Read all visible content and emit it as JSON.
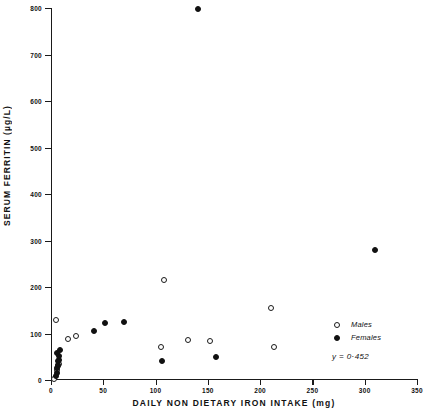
{
  "chart_data": {
    "type": "scatter",
    "title": "",
    "xlabel": "DAILY  NON DIETARY  IRON  INTAKE  (mg)",
    "ylabel": "SERUM  FERRITIN  (µg/L)",
    "xlim": [
      0,
      350
    ],
    "ylim": [
      0,
      800
    ],
    "xticks": [
      0,
      50,
      100,
      150,
      200,
      250,
      300,
      350
    ],
    "yticks": [
      0,
      100,
      200,
      300,
      400,
      500,
      600,
      700,
      800
    ],
    "xtick_labels": [
      "0",
      "50",
      "100",
      "150",
      "200",
      "250",
      "300",
      "350"
    ],
    "ytick_labels": [
      "0",
      "100",
      "200",
      "300",
      "400",
      "500",
      "600",
      "700",
      "800"
    ],
    "grid": false,
    "legend_position": "bottom-right",
    "annotations": [
      "y = 0·452"
    ],
    "series": [
      {
        "name": "Males",
        "marker": "open-circle",
        "color": "#111111",
        "points": [
          {
            "x": 3,
            "y": 2
          },
          {
            "x": 6,
            "y": 22
          },
          {
            "x": 7,
            "y": 30
          },
          {
            "x": 8,
            "y": 35
          },
          {
            "x": 5,
            "y": 130
          },
          {
            "x": 16,
            "y": 88
          },
          {
            "x": 24,
            "y": 95
          },
          {
            "x": 108,
            "y": 215
          },
          {
            "x": 105,
            "y": 72
          },
          {
            "x": 131,
            "y": 85
          },
          {
            "x": 152,
            "y": 83
          },
          {
            "x": 210,
            "y": 155
          },
          {
            "x": 213,
            "y": 72
          }
        ]
      },
      {
        "name": "Females",
        "marker": "filled-circle",
        "color": "#111111",
        "points": [
          {
            "x": 5,
            "y": 8
          },
          {
            "x": 6,
            "y": 14
          },
          {
            "x": 6,
            "y": 26
          },
          {
            "x": 7,
            "y": 33
          },
          {
            "x": 7,
            "y": 40
          },
          {
            "x": 8,
            "y": 44
          },
          {
            "x": 8,
            "y": 52
          },
          {
            "x": 6,
            "y": 58
          },
          {
            "x": 9,
            "y": 64
          },
          {
            "x": 41,
            "y": 105
          },
          {
            "x": 52,
            "y": 122
          },
          {
            "x": 70,
            "y": 125
          },
          {
            "x": 106,
            "y": 40
          },
          {
            "x": 141,
            "y": 797
          },
          {
            "x": 158,
            "y": 50
          },
          {
            "x": 310,
            "y": 280
          }
        ]
      }
    ]
  },
  "axis": {
    "y_title": "SERUM  FERRITIN  (µg/L)",
    "x_title": "DAILY  NON DIETARY  IRON  INTAKE  (mg)"
  },
  "legend": {
    "items": [
      {
        "label": "Males",
        "marker": "open-circle"
      },
      {
        "label": "Females",
        "marker": "filled-circle"
      }
    ],
    "equation": "y = 0·452"
  }
}
